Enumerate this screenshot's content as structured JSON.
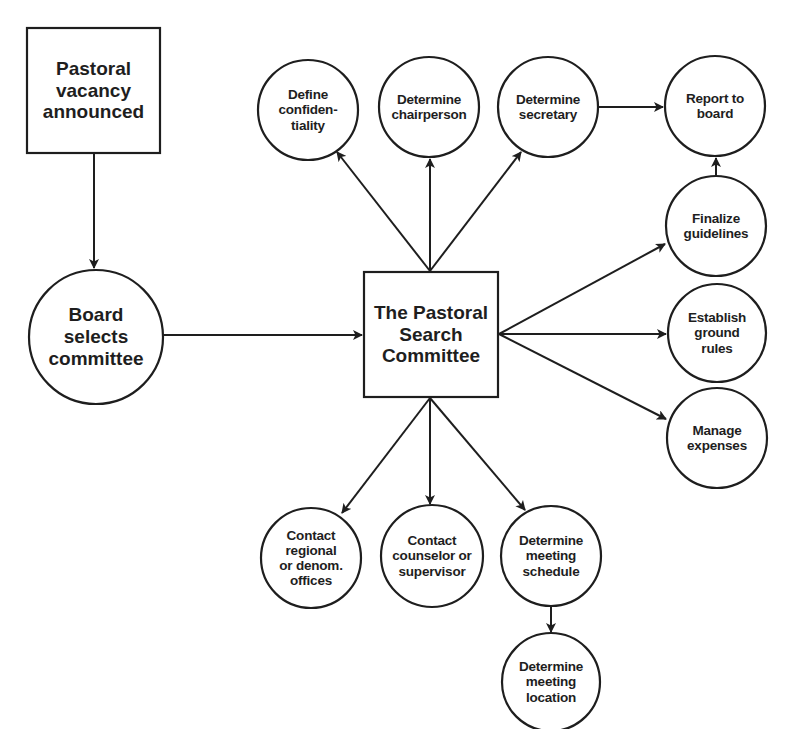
{
  "diagram": {
    "nodes": {
      "vacancy": {
        "label": "Pastoral\nvacancy\nannounced",
        "shape": "rect"
      },
      "board": {
        "label": "Board\nselects\ncommittee",
        "shape": "circle"
      },
      "committee": {
        "label": "The Pastoral\nSearch\nCommittee",
        "shape": "rect"
      },
      "confidentiality": {
        "label": "Define\nconfiden-\ntiality",
        "shape": "circle"
      },
      "chairperson": {
        "label": "Determine\nchairperson",
        "shape": "circle"
      },
      "secretary": {
        "label": "Determine\nsecretary",
        "shape": "circle"
      },
      "report": {
        "label": "Report to\nboard",
        "shape": "circle"
      },
      "guidelines": {
        "label": "Finalize\nguidelines",
        "shape": "circle"
      },
      "groundrules": {
        "label": "Establish\nground\nrules",
        "shape": "circle"
      },
      "expenses": {
        "label": "Manage\nexpenses",
        "shape": "circle"
      },
      "regional": {
        "label": "Contact\nregional\nor denom.\noffices",
        "shape": "circle"
      },
      "counselor": {
        "label": "Contact\ncounselor or\nsupervisor",
        "shape": "circle"
      },
      "schedule": {
        "label": "Determine\nmeeting\nschedule",
        "shape": "circle"
      },
      "location": {
        "label": "Determine\nmeeting\nlocation",
        "shape": "circle"
      }
    },
    "edges": [
      [
        "vacancy",
        "board"
      ],
      [
        "board",
        "committee"
      ],
      [
        "committee",
        "confidentiality"
      ],
      [
        "committee",
        "chairperson"
      ],
      [
        "committee",
        "secretary"
      ],
      [
        "secretary",
        "report"
      ],
      [
        "guidelines",
        "report"
      ],
      [
        "committee",
        "guidelines"
      ],
      [
        "committee",
        "groundrules"
      ],
      [
        "committee",
        "expenses"
      ],
      [
        "committee",
        "regional"
      ],
      [
        "committee",
        "counselor"
      ],
      [
        "committee",
        "schedule"
      ],
      [
        "schedule",
        "location"
      ]
    ],
    "colors": {
      "stroke": "#1e1e1e",
      "background": "#ffffff"
    }
  }
}
